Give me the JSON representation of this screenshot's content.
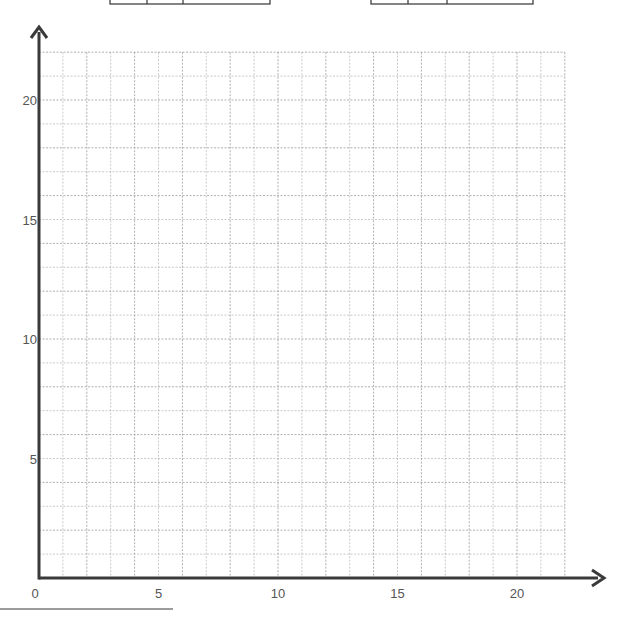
{
  "chart_data": {
    "type": "scatter",
    "title": "",
    "xlabel": "",
    "ylabel": "",
    "xlim": [
      0,
      22
    ],
    "ylim": [
      0,
      22
    ],
    "x_ticks": [
      0,
      5,
      10,
      15,
      20
    ],
    "y_ticks": [
      5,
      10,
      15,
      20
    ],
    "x_tick_labels": [
      "0",
      "5",
      "10",
      "15",
      "20"
    ],
    "y_tick_labels": [
      "5",
      "10",
      "15",
      "20"
    ],
    "grid": true,
    "grid_step": 1,
    "series": [],
    "legend": null
  },
  "colors": {
    "axis": "#3a3a3a",
    "grid": "#9a9a9a",
    "label": "#555555",
    "table_border": "#333333"
  },
  "layout": {
    "origin_px": [
      39,
      578
    ],
    "unit_px": 23.9
  },
  "tables": [
    {
      "x": 110,
      "dividers": [
        147,
        183
      ],
      "right": 270
    },
    {
      "x": 371,
      "dividers": [
        408,
        447
      ],
      "right": 533
    }
  ]
}
